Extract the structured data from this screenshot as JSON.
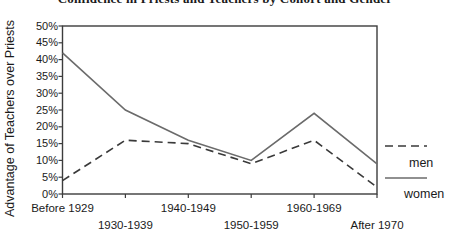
{
  "chart_data": {
    "type": "line",
    "title": "Confidence in Priests and Teachers by Cohort and Gender",
    "ylabel": "Advantage of Teachers over Priests",
    "xlabel": "",
    "categories": [
      "Before 1929",
      "1930-1939",
      "1940-1949",
      "1950-1959",
      "1960-1969",
      "After 1970"
    ],
    "series": [
      {
        "name": "men",
        "line_style": "dashed",
        "color": "#3a3a3a",
        "values": [
          4,
          16,
          15,
          9,
          16,
          2
        ]
      },
      {
        "name": "women",
        "line_style": "solid",
        "color": "#6b6b6b",
        "values": [
          42,
          25,
          16,
          10,
          24,
          9
        ]
      }
    ],
    "ylim": [
      0,
      50
    ],
    "y_tick_labels": [
      "0%",
      "5%",
      "10%",
      "15%",
      "20%",
      "25%",
      "30%",
      "35%",
      "40%",
      "45%",
      "50%"
    ],
    "grid": false,
    "legend_position": "right",
    "axis_color": "#3c3c3c",
    "text_color": "#1a1a1a"
  }
}
